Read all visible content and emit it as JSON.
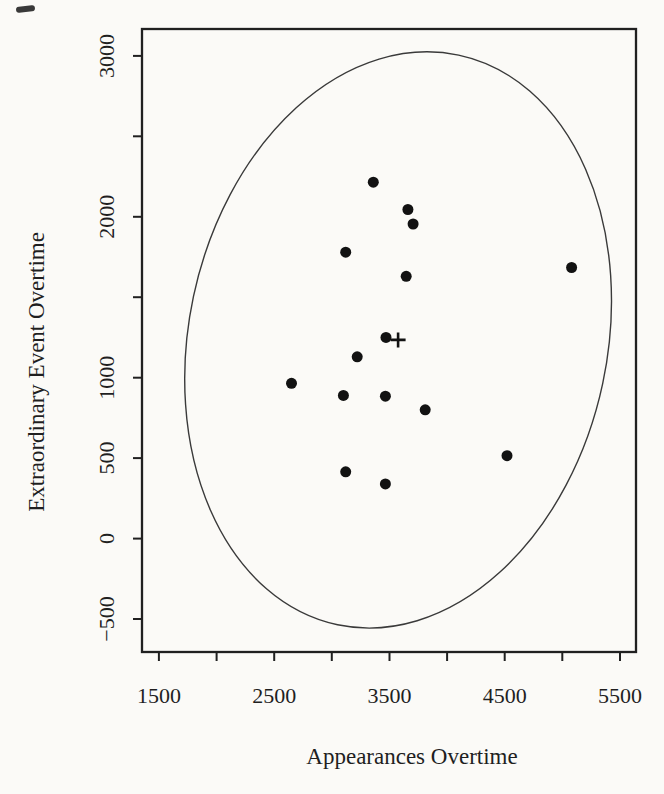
{
  "figure": {
    "kind": "scanned R scatter plot with bivariate confidence ellipse",
    "ink_color": "#1f1f1f",
    "paper_color": "#fbfaf7"
  },
  "chart_data": {
    "type": "scatter",
    "title": "",
    "xlabel": "Appearances Overtime",
    "ylabel": "Extraordinary Event Overtime",
    "xlim": [
      1353,
      5639
    ],
    "ylim": [
      -705,
      3167
    ],
    "grid": false,
    "legend": null,
    "x_ticks": {
      "values": [
        1500,
        2000,
        2500,
        3000,
        3500,
        4000,
        4500,
        5000,
        5500
      ],
      "labels": [
        "1500",
        "",
        "2500",
        "",
        "3500",
        "",
        "4500",
        "",
        "5500"
      ]
    },
    "y_ticks": {
      "values": [
        -500,
        0,
        500,
        1000,
        1500,
        2000,
        2500,
        3000
      ],
      "labels": [
        "−500",
        "0",
        "500",
        "1000",
        "",
        "2000",
        "",
        "3000"
      ]
    },
    "points": [
      [
        3360,
        2215
      ],
      [
        3660,
        2045
      ],
      [
        3705,
        1955
      ],
      [
        3120,
        1780
      ],
      [
        5080,
        1685
      ],
      [
        3645,
        1630
      ],
      [
        3470,
        1250
      ],
      [
        3220,
        1130
      ],
      [
        2650,
        965
      ],
      [
        3100,
        890
      ],
      [
        3465,
        885
      ],
      [
        3810,
        800
      ],
      [
        4520,
        515
      ],
      [
        3120,
        415
      ],
      [
        3465,
        340
      ]
    ],
    "mean_marker": {
      "symbol": "plus",
      "x": 3575,
      "y": 1235
    },
    "ellipse": {
      "cx": 3575,
      "cy": 1235,
      "semi_x": 1815,
      "semi_y": 1810,
      "tilt_deg": 12
    }
  }
}
